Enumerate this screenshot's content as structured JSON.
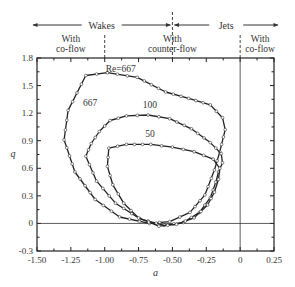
{
  "chart_data": {
    "type": "line",
    "title": "",
    "xlabel": "a",
    "ylabel": "q",
    "xlim": [
      -1.5,
      0.25
    ],
    "ylim": [
      -0.3,
      1.8
    ],
    "x_ticks": [
      "-1.50",
      "-1.25",
      "-1.00",
      "-0.75",
      "-0.50",
      "-0.25",
      "0",
      "0.25"
    ],
    "y_ticks": [
      "1.8",
      "1.5",
      "1.2",
      "0.9",
      "0.6",
      "0.3",
      "0",
      "-0.3"
    ],
    "grid": false,
    "legend": "none (curves labeled inline)",
    "regions": {
      "top_labels": [
        {
          "text": "Wakes",
          "span": [
            -1.5,
            -0.5
          ]
        },
        {
          "text": "Jets",
          "span": [
            -0.5,
            0.25
          ]
        }
      ],
      "sub_labels": [
        {
          "line1": "With",
          "line2": "co-flow",
          "span": [
            -1.5,
            -1.0
          ]
        },
        {
          "line1": "With",
          "line2": "counter-flow",
          "span": [
            -1.0,
            0.0
          ]
        },
        {
          "line1": "With",
          "line2": "co-flow",
          "span": [
            0.0,
            0.25
          ]
        }
      ],
      "dividers": [
        -1.0,
        -0.5,
        0.0
      ]
    },
    "reference_lines": {
      "vertical_at_a": 0,
      "horizontal_at_q": 0
    },
    "series": [
      {
        "name": "Re=667",
        "label": "Re=667",
        "inner_label": "667",
        "x": [
          -1.14,
          -0.98,
          -0.76,
          -0.55,
          -0.38,
          -0.22,
          -0.13,
          -0.11,
          -0.15,
          -0.19,
          -0.26,
          -0.37,
          -0.52,
          -0.67,
          -0.89,
          -1.07,
          -1.22,
          -1.3,
          -1.27,
          -1.14
        ],
        "y": [
          1.61,
          1.64,
          1.59,
          1.43,
          1.36,
          1.29,
          1.15,
          1.02,
          0.78,
          0.58,
          0.31,
          0.12,
          0.02,
          0.0,
          0.07,
          0.26,
          0.56,
          0.91,
          1.23,
          1.61
        ]
      },
      {
        "name": "Re=100",
        "label": "100",
        "x": [
          -0.96,
          -0.84,
          -0.68,
          -0.52,
          -0.36,
          -0.22,
          -0.14,
          -0.13,
          -0.16,
          -0.18,
          -0.22,
          -0.3,
          -0.42,
          -0.56,
          -0.74,
          -0.92,
          -1.06,
          -1.14,
          -1.1,
          -1.04,
          -0.96
        ],
        "y": [
          1.12,
          1.17,
          1.18,
          1.14,
          1.03,
          0.88,
          0.76,
          0.66,
          0.56,
          0.45,
          0.28,
          0.12,
          0.01,
          -0.02,
          0.05,
          0.22,
          0.46,
          0.73,
          0.87,
          1.0,
          1.12
        ]
      },
      {
        "name": "Re=50",
        "label": "50",
        "x": [
          -0.97,
          -0.84,
          -0.66,
          -0.5,
          -0.34,
          -0.2,
          -0.15,
          -0.16,
          -0.19,
          -0.24,
          -0.34,
          -0.47,
          -0.6,
          -0.75,
          -0.86,
          -0.94,
          -0.98,
          -0.97
        ],
        "y": [
          0.82,
          0.86,
          0.86,
          0.83,
          0.78,
          0.7,
          0.6,
          0.48,
          0.34,
          0.2,
          0.06,
          -0.01,
          -0.03,
          0.06,
          0.22,
          0.42,
          0.62,
          0.82
        ]
      }
    ]
  }
}
